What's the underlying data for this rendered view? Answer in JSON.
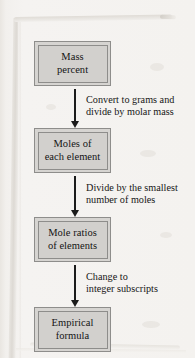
{
  "diagram": {
    "orientation": "vertical-top-down",
    "background_color": "#f3f1ee",
    "box_fill_color": "#d2d0cd",
    "box_border_color": "#8e8d8b",
    "arrow_color": "#1b1b1b",
    "text_color": "#141414",
    "nodes": [
      {
        "id": "mass-percent",
        "line1": "Mass",
        "line2": "percent"
      },
      {
        "id": "moles-each",
        "line1": "Moles of",
        "line2": "each element"
      },
      {
        "id": "mole-ratios",
        "line1": "Mole ratios",
        "line2": "of elements"
      },
      {
        "id": "empirical-formula",
        "line1": "Empirical",
        "line2": "formula"
      }
    ],
    "arrows": [
      {
        "id": "arrow-mass-to-moles",
        "from": "mass-percent",
        "to": "moles-each",
        "label_line1": "Convert to grams and",
        "label_line2": "divide by molar mass"
      },
      {
        "id": "arrow-moles-to-ratios",
        "from": "moles-each",
        "to": "mole-ratios",
        "label_line1": "Divide by the smallest",
        "label_line2": "number of moles"
      },
      {
        "id": "arrow-ratios-to-formula",
        "from": "mole-ratios",
        "to": "empirical-formula",
        "label_line1": "Change to",
        "label_line2": "integer subscripts"
      }
    ]
  }
}
